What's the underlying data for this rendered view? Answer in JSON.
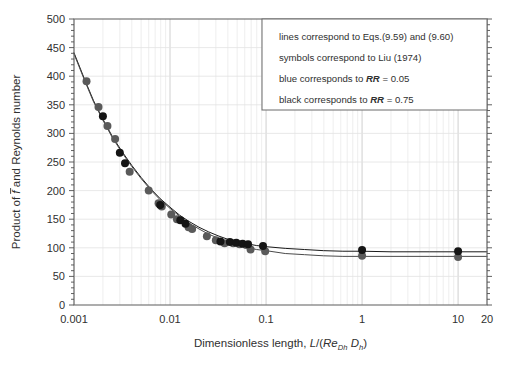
{
  "chart_data": {
    "type": "scatter",
    "title": "",
    "xlabel": "Dimensionless length, L/(Re_Dh D_h)",
    "xlabel_parts": {
      "lead": "Dimensionless length, ",
      "L": "L",
      "slash_open": "/(",
      "Re": "Re",
      "Re_sub": "Dh",
      "space": " ",
      "D": "D",
      "D_sub": "h",
      "close": ")"
    },
    "ylabel": "Product of f̄ and Reynolds number",
    "ylabel_parts": {
      "lead": "Product of ",
      "fbar": "f",
      "tail": " and Reynolds number"
    },
    "xscale": "log",
    "yscale": "linear",
    "xlim": [
      0.001,
      20
    ],
    "ylim": [
      0,
      500
    ],
    "xticks": [
      0.001,
      0.01,
      0.1,
      1,
      10,
      20
    ],
    "xticklabels": [
      "0.001",
      "0.01",
      "0.1",
      "1",
      "10",
      "20"
    ],
    "yticks": [
      0,
      50,
      100,
      150,
      200,
      250,
      300,
      350,
      400,
      450,
      500
    ],
    "yticklabels": [
      "0",
      "50",
      "100",
      "150",
      "200",
      "250",
      "300",
      "350",
      "400",
      "450",
      "500"
    ],
    "y_minor_step": 10,
    "grid": "both-axes-light",
    "legend_position": "top-right",
    "series": [
      {
        "name": "blue corresponds to RR = 0.05",
        "symbol_color": "#5a5a5a",
        "marker": "circle",
        "RR": 0.05,
        "points": [
          [
            0.00135,
            391
          ],
          [
            0.0018,
            346
          ],
          [
            0.00223,
            313
          ],
          [
            0.00268,
            290
          ],
          [
            0.0038,
            233
          ],
          [
            0.006,
            200
          ],
          [
            0.0076,
            178
          ],
          [
            0.0082,
            172
          ],
          [
            0.0103,
            158
          ],
          [
            0.0118,
            150
          ],
          [
            0.0156,
            136
          ],
          [
            0.017,
            133
          ],
          [
            0.0242,
            120
          ],
          [
            0.03,
            113
          ],
          [
            0.037,
            108
          ],
          [
            0.0455,
            108
          ],
          [
            0.053,
            106
          ],
          [
            0.062,
            105
          ],
          [
            0.069,
            97
          ],
          [
            0.098,
            94
          ],
          [
            1.0,
            86
          ],
          [
            10.0,
            84
          ]
        ]
      },
      {
        "name": "black corresponds to RR = 0.75",
        "symbol_color": "#151515",
        "marker": "circle",
        "RR": 0.75,
        "points": [
          [
            0.002,
            330
          ],
          [
            0.003,
            266
          ],
          [
            0.0034,
            248
          ],
          [
            0.0079,
            175
          ],
          [
            0.0128,
            148
          ],
          [
            0.0145,
            142
          ],
          [
            0.0335,
            111
          ],
          [
            0.042,
            110
          ],
          [
            0.049,
            109
          ],
          [
            0.057,
            107
          ],
          [
            0.065,
            106
          ],
          [
            0.093,
            103
          ],
          [
            1.0,
            96
          ],
          [
            10.0,
            94
          ]
        ]
      }
    ],
    "curves": [
      {
        "name": "Eq. (9.59) black line RR = 0.75",
        "color": "#1a1a1a",
        "points": [
          [
            0.001,
            441
          ],
          [
            0.0013,
            393
          ],
          [
            0.0016,
            357
          ],
          [
            0.002,
            325
          ],
          [
            0.0025,
            295
          ],
          [
            0.0032,
            267
          ],
          [
            0.004,
            244
          ],
          [
            0.005,
            223
          ],
          [
            0.0063,
            203
          ],
          [
            0.0079,
            186
          ],
          [
            0.01,
            171
          ],
          [
            0.0126,
            157
          ],
          [
            0.0158,
            146
          ],
          [
            0.02,
            136
          ],
          [
            0.0251,
            128
          ],
          [
            0.0316,
            121
          ],
          [
            0.0398,
            115
          ],
          [
            0.0501,
            111
          ],
          [
            0.0631,
            107
          ],
          [
            0.0794,
            104
          ],
          [
            0.1,
            102
          ],
          [
            0.1585,
            99
          ],
          [
            0.2512,
            97
          ],
          [
            0.3981,
            95
          ],
          [
            0.631,
            94
          ],
          [
            1.0,
            94
          ],
          [
            2.0,
            93
          ],
          [
            5.0,
            93
          ],
          [
            10.0,
            93
          ],
          [
            20.0,
            93
          ]
        ]
      },
      {
        "name": "Eq. (9.60) gray line RR = 0.05",
        "color": "#4a4a4a",
        "points": [
          [
            0.001,
            439
          ],
          [
            0.0013,
            391
          ],
          [
            0.0016,
            355
          ],
          [
            0.002,
            323
          ],
          [
            0.0025,
            293
          ],
          [
            0.0032,
            265
          ],
          [
            0.004,
            242
          ],
          [
            0.005,
            221
          ],
          [
            0.0063,
            201
          ],
          [
            0.0079,
            184
          ],
          [
            0.01,
            169
          ],
          [
            0.0126,
            155
          ],
          [
            0.0158,
            143
          ],
          [
            0.02,
            133
          ],
          [
            0.0251,
            124
          ],
          [
            0.0316,
            117
          ],
          [
            0.0398,
            110
          ],
          [
            0.0501,
            105
          ],
          [
            0.0631,
            101
          ],
          [
            0.0794,
            97
          ],
          [
            0.1,
            95
          ],
          [
            0.1585,
            90
          ],
          [
            0.2512,
            88
          ],
          [
            0.3981,
            86
          ],
          [
            0.631,
            85
          ],
          [
            1.0,
            85
          ],
          [
            2.0,
            85
          ],
          [
            5.0,
            85
          ],
          [
            10.0,
            85
          ],
          [
            20.0,
            85
          ]
        ]
      }
    ]
  },
  "legend": {
    "lines": [
      {
        "id": "l1",
        "pre": "lines correspond to Eqs.(9.59) and (9.60)",
        "ital": "",
        "post": ""
      },
      {
        "id": "l2",
        "pre": "symbols correspond to Liu (1974)",
        "ital": "",
        "post": ""
      },
      {
        "id": "l3",
        "pre": "blue corresponds to ",
        "ital": "RR",
        "post": " = 0.05"
      },
      {
        "id": "l4",
        "pre": "black corresponds to ",
        "ital": "RR",
        "post": " = 0.75"
      }
    ]
  }
}
